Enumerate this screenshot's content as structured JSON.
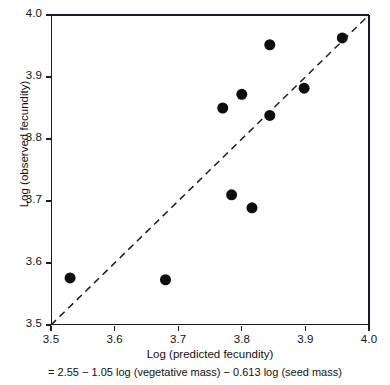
{
  "chart_data": {
    "type": "scatter",
    "title": "",
    "xlabel": "Log (predicted fecundity)",
    "ylabel": "Log (observed fecundity)",
    "caption": "= 2.55 − 1.05 log (vegetative mass) − 0.613 log (seed mass)",
    "xlim": [
      3.5,
      4.0
    ],
    "ylim": [
      3.5,
      4.0
    ],
    "xticks": [
      "3.5",
      "3.6",
      "3.7",
      "3.8",
      "3.9",
      "4.0"
    ],
    "yticks": [
      "3.5",
      "3.6",
      "3.7",
      "3.8",
      "3.9",
      "4.0"
    ],
    "xtick_values": [
      3.5,
      3.6,
      3.7,
      3.8,
      3.9,
      4.0
    ],
    "ytick_values": [
      3.5,
      3.6,
      3.7,
      3.8,
      3.9,
      4.0
    ],
    "grid": false,
    "legend": false,
    "marker": "filled-circle",
    "marker_color": "#0d0d12",
    "marker_size_px": 11,
    "reference_line": {
      "name": "identity-line",
      "style": "dashed",
      "color": "#1b1b2b",
      "from": [
        3.5,
        3.5
      ],
      "to": [
        4.0,
        4.0
      ]
    },
    "points": [
      {
        "x": 3.53,
        "y": 3.576
      },
      {
        "x": 3.68,
        "y": 3.573
      },
      {
        "x": 3.77,
        "y": 3.85
      },
      {
        "x": 3.8,
        "y": 3.872
      },
      {
        "x": 3.784,
        "y": 3.71
      },
      {
        "x": 3.816,
        "y": 3.689
      },
      {
        "x": 3.844,
        "y": 3.952
      },
      {
        "x": 3.844,
        "y": 3.838
      },
      {
        "x": 3.898,
        "y": 3.882
      },
      {
        "x": 3.958,
        "y": 3.963
      }
    ]
  }
}
